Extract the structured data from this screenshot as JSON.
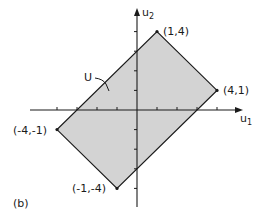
{
  "figure": {
    "panel_label": "(b)",
    "region_label": "U",
    "axes": {
      "x_label": "u",
      "x_sub": "1",
      "y_label": "u",
      "y_sub": "2"
    },
    "vertices": [
      {
        "label": "(1,4)",
        "u1": 1,
        "u2": 4
      },
      {
        "label": "(4,1)",
        "u1": 4,
        "u2": 1
      },
      {
        "label": "(-1,-4)",
        "u1": -1,
        "u2": -4
      },
      {
        "label": "(-4,-1)",
        "u1": -4,
        "u2": -1
      }
    ],
    "colors": {
      "fill": "#d3d3d3",
      "stroke": "#1a1a1a"
    }
  }
}
